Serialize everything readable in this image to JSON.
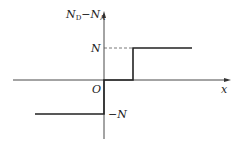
{
  "diagram": {
    "y_axis_label_main_N": "N",
    "y_axis_label_sub_D": "D",
    "y_axis_label_minus": "−",
    "y_axis_label_main_N2": "N",
    "y_axis_label_sub_A": "A",
    "x_axis_label": "x",
    "origin_label": "O",
    "level_high_label": "N",
    "level_low_label": "−N",
    "colors": {
      "line": "#222222",
      "axis": "#333333"
    }
  }
}
